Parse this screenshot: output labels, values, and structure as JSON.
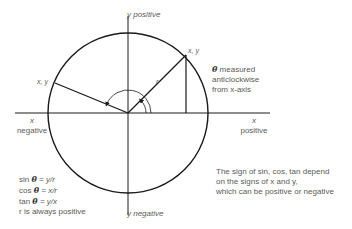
{
  "diagram": {
    "axes": {
      "y_positive": "y positive",
      "y_negative": "y negative",
      "x_negative_var": "x",
      "x_negative_word": "negative",
      "x_positive_var": "x",
      "x_positive_word": "positive"
    },
    "points": {
      "q1_label": "x, y",
      "q2_label": "x, y",
      "radius_label": "r"
    },
    "note_angle": {
      "theta": "θ",
      "line1": " measured",
      "line2": "anticlockwise",
      "line3": "from x-axis"
    },
    "formulas": [
      {
        "fn": "sin ",
        "theta": "θ",
        "rest": " = y/r"
      },
      {
        "fn": "cos ",
        "theta": "θ",
        "rest": " = x/r"
      },
      {
        "fn": "tan ",
        "theta": "θ",
        "rest": " = y/x"
      }
    ],
    "r_note": "r is always positive",
    "sign_note": {
      "line1": "The sign of sin, cos, tan depend",
      "line2": "on the signs of x and y,",
      "line3": "which can be positive or negative"
    },
    "colors": {
      "stroke": "#1a1a1a",
      "text": "#5a5a5a"
    }
  }
}
